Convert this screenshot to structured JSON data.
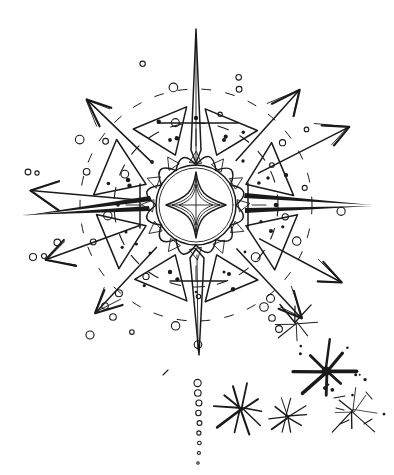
{
  "artwork": {
    "title": "Hand-drawn starburst mandala with radiating arrows",
    "medium": "pen-and-ink line sketch",
    "background_color": "#ffffff",
    "ink_color": "#1a1a1a",
    "canvas": {
      "width": 394,
      "height": 475
    }
  },
  "core": {
    "name": "central-medallion",
    "center": {
      "x": 196,
      "y": 205
    },
    "inner_circle_radius": 38,
    "outer_circle_radius": 40,
    "diamond": {
      "name": "four-point-concave-star",
      "half_width": 30,
      "half_height": 33,
      "concavity": 13,
      "inner_rings": 2,
      "cross_lines": 2
    },
    "petal_ring": {
      "name": "scalloped-petal-ring",
      "petal_count": 12,
      "inner_radius": 40,
      "outer_radius": 55,
      "triangle_count": 12,
      "triangle_size": 7
    }
  },
  "dashed_rings": [
    {
      "name": "inner-dashed-orbit",
      "radius": 82,
      "dash": "11 13"
    },
    {
      "name": "outer-dashed-orbit",
      "radius": 116,
      "dash": "9 15"
    }
  ],
  "wedges": {
    "name": "radiating-triangular-wedges",
    "count": 8,
    "inner_radius": 54,
    "outer_radius": 104,
    "half_angle_deg": 17,
    "dot_count_per_wedge": 2
  },
  "spikes": [
    {
      "name": "spike-north",
      "angle_deg": 270,
      "length": 176,
      "half_width": 9,
      "style": "tapered-cone"
    },
    {
      "name": "spike-south",
      "angle_deg": 90,
      "length": 150,
      "half_width": 11,
      "style": "tapered-cone"
    },
    {
      "name": "spike-west",
      "angle_deg": 180,
      "length": 174,
      "half_width": 8,
      "style": "tapered-blade"
    },
    {
      "name": "spike-east",
      "angle_deg": 0,
      "length": 178,
      "half_width": 8,
      "style": "tapered-blade"
    }
  ],
  "arrows": [
    {
      "name": "arrow-northwest",
      "angle_deg": 224,
      "tip_distance": 152,
      "tail_distance": 62,
      "head_size": 26
    },
    {
      "name": "arrow-northeast",
      "angle_deg": 312,
      "tip_distance": 155,
      "tail_distance": 60,
      "head_size": 27
    },
    {
      "name": "arrow-east-northeast",
      "angle_deg": 333,
      "tip_distance": 172,
      "tail_distance": 70,
      "head_size": 24
    },
    {
      "name": "arrow-west",
      "angle_deg": 185,
      "tip_distance": 166,
      "tail_distance": 52,
      "head_size": 30
    },
    {
      "name": "arrow-west-southwest",
      "angle_deg": 160,
      "tip_distance": 160,
      "tail_distance": 60,
      "head_size": 27
    },
    {
      "name": "arrow-southwest",
      "angle_deg": 133,
      "tip_distance": 148,
      "tail_distance": 58,
      "head_size": 25
    },
    {
      "name": "arrow-southeast",
      "angle_deg": 47,
      "tip_distance": 155,
      "tail_distance": 60,
      "head_size": 25
    },
    {
      "name": "arrow-east-southeast",
      "angle_deg": 28,
      "tip_distance": 165,
      "tail_distance": 72,
      "head_size": 24
    }
  ],
  "small_circles": {
    "name": "scattered-open-circles",
    "count": 34,
    "radius_range": [
      2.0,
      4.4
    ],
    "description": "hollow pen circles scattered along and beyond the dashed orbits"
  },
  "dotted_tail": {
    "name": "descending-dotted-trail",
    "start": {
      "x": 199,
      "y": 383
    },
    "end": {
      "x": 199,
      "y": 463
    },
    "bead_count": 9,
    "radius_start": 3.6,
    "radius_end": 1.2
  },
  "sparkles": [
    {
      "name": "sparkle-small-upper",
      "x": 296,
      "y": 323,
      "rays": 8,
      "radius": 20,
      "weight": 1.1,
      "dots": 0
    },
    {
      "name": "sparkle-bold-large",
      "x": 326,
      "y": 371,
      "rays": 8,
      "radius": 26,
      "weight": 3.0,
      "dots": 6
    },
    {
      "name": "sparkle-left-lower",
      "x": 241,
      "y": 409,
      "rays": 10,
      "radius": 25,
      "weight": 2.0,
      "dots": 0
    },
    {
      "name": "sparkle-mid-lower",
      "x": 287,
      "y": 417,
      "rays": 10,
      "radius": 21,
      "weight": 1.6,
      "dots": 0
    },
    {
      "name": "sparkle-sketchy-right",
      "x": 353,
      "y": 411,
      "rays": 8,
      "radius": 24,
      "weight": 1.2,
      "dots": 5
    }
  ],
  "ink_dots": {
    "name": "solid-ink-dots",
    "count": 16,
    "radius_range": [
      1.2,
      2.3
    ]
  }
}
